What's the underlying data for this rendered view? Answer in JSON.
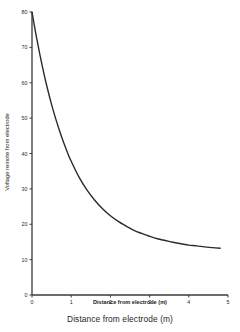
{
  "chart_data": {
    "type": "line",
    "title": "",
    "xlabel": "Distance from electrode (m)",
    "ylabel": "Voltage remote from electrode",
    "xlim": [
      0,
      5
    ],
    "ylim": [
      0,
      80
    ],
    "grid": false,
    "legend": null,
    "x_ticks": [
      "0",
      "1",
      "2",
      "3",
      "4",
      "5"
    ],
    "x_tick_values": [
      0,
      1,
      2,
      3,
      4,
      5
    ],
    "y_ticks": [
      "0",
      "10",
      "20",
      "30",
      "40",
      "50",
      "60",
      "70",
      "80"
    ],
    "y_tick_values": [
      0,
      10,
      20,
      30,
      40,
      50,
      60,
      70,
      80
    ],
    "series": [
      {
        "name": "Voltage",
        "x": [
          0,
          0.1,
          0.2,
          0.3,
          0.4,
          0.5,
          0.6,
          0.7,
          0.8,
          0.9,
          1.0,
          1.2,
          1.4,
          1.6,
          1.8,
          2.0,
          2.2,
          2.4,
          2.6,
          2.8,
          3.0,
          3.2,
          3.4,
          3.6,
          3.8,
          4.0,
          4.2,
          4.4,
          4.6,
          4.8
        ],
        "values": [
          80.0,
          73.7,
          68.0,
          62.8,
          58.1,
          53.8,
          50.0,
          46.5,
          43.3,
          40.4,
          37.8,
          33.3,
          29.7,
          26.8,
          24.4,
          22.4,
          20.8,
          19.5,
          18.3,
          17.4,
          16.6,
          15.9,
          15.4,
          14.9,
          14.5,
          14.1,
          13.9,
          13.6,
          13.4,
          13.2
        ]
      }
    ],
    "curve_description": "Exponential decay from 80 at x=0 approaching an asymptote near 10",
    "curve_color": "#2b2b2b",
    "axis_color": "#3a3a3a",
    "background_color": "#ffffff"
  },
  "caption": {
    "text": "Distance from electrode (m)"
  }
}
